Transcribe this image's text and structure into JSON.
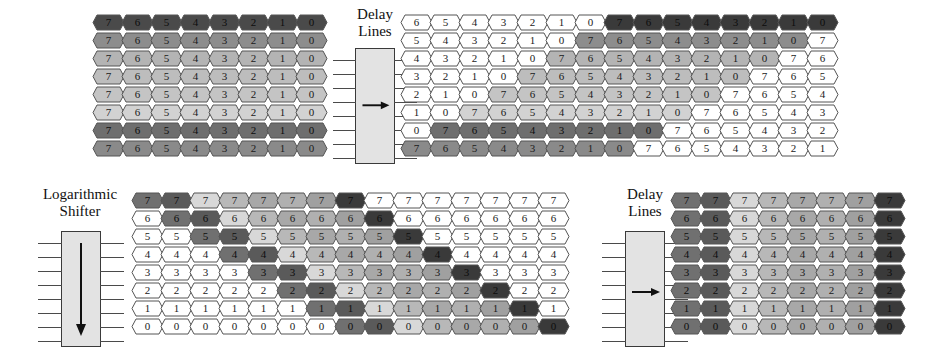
{
  "diagram": {
    "palette": {
      "hex_white": "#ffffff",
      "hex_outline": "#555555",
      "module_fill": "#e3e3e3",
      "module_stroke": "#3a3a3a",
      "text": "#1a1a1a",
      "shades": [
        "#707070",
        "#5a5a5a",
        "#d8d8d8",
        "#b8b8b8",
        "#a8a8a8",
        "#b0b0b0",
        "#a0a0a0",
        "#3a3a3a"
      ],
      "row_shades_topleft": [
        "#4a4a4a",
        "#8d8d8d",
        "#b4b4b4",
        "#bdbdbd",
        "#c4c4c4",
        "#d2d2d2",
        "#6e6e6e",
        "#8a8a8a"
      ]
    },
    "modules": [
      {
        "id": "delay-lines-top",
        "label_line1": "Delay",
        "label_line2": "Lines",
        "arrow": "right-arrow-icon",
        "pin_count": 8
      },
      {
        "id": "logarithmic-shifter",
        "label_line1": "Logarithmic",
        "label_line2": "Shifter",
        "arrow": "down-arrow-icon",
        "pin_count": 8
      },
      {
        "id": "delay-lines-bottom",
        "label_line1": "Delay",
        "label_line2": "Lines",
        "arrow": "right-arrow-icon",
        "pin_count": 8
      }
    ],
    "blocks": {
      "top_left": {
        "name": "delay-lines-input-grid",
        "rows": 8,
        "cols": 8,
        "cells": [
          [
            "7",
            "6",
            "5",
            "4",
            "3",
            "2",
            "1",
            "0"
          ],
          [
            "7",
            "6",
            "5",
            "4",
            "3",
            "2",
            "1",
            "0"
          ],
          [
            "7",
            "6",
            "5",
            "4",
            "3",
            "2",
            "1",
            "0"
          ],
          [
            "7",
            "6",
            "5",
            "4",
            "3",
            "2",
            "1",
            "0"
          ],
          [
            "7",
            "6",
            "5",
            "4",
            "3",
            "2",
            "1",
            "0"
          ],
          [
            "7",
            "6",
            "5",
            "4",
            "3",
            "2",
            "1",
            "0"
          ],
          [
            "7",
            "6",
            "5",
            "4",
            "3",
            "2",
            "1",
            "0"
          ],
          [
            "7",
            "6",
            "5",
            "4",
            "3",
            "2",
            "1",
            "0"
          ]
        ],
        "fills": [
          [
            "#4a4a4a",
            "#4a4a4a",
            "#4a4a4a",
            "#4a4a4a",
            "#4a4a4a",
            "#4a4a4a",
            "#4a4a4a",
            "#4a4a4a"
          ],
          [
            "#8d8d8d",
            "#8d8d8d",
            "#8d8d8d",
            "#8d8d8d",
            "#8d8d8d",
            "#8d8d8d",
            "#8d8d8d",
            "#8d8d8d"
          ],
          [
            "#b4b4b4",
            "#b4b4b4",
            "#b4b4b4",
            "#b4b4b4",
            "#b4b4b4",
            "#b4b4b4",
            "#b4b4b4",
            "#b4b4b4"
          ],
          [
            "#bdbdbd",
            "#bdbdbd",
            "#bdbdbd",
            "#bdbdbd",
            "#bdbdbd",
            "#bdbdbd",
            "#bdbdbd",
            "#bdbdbd"
          ],
          [
            "#c4c4c4",
            "#c4c4c4",
            "#c4c4c4",
            "#c4c4c4",
            "#c4c4c4",
            "#c4c4c4",
            "#c4c4c4",
            "#c4c4c4"
          ],
          [
            "#d2d2d2",
            "#d2d2d2",
            "#d2d2d2",
            "#d2d2d2",
            "#d2d2d2",
            "#d2d2d2",
            "#d2d2d2",
            "#d2d2d2"
          ],
          [
            "#6e6e6e",
            "#6e6e6e",
            "#6e6e6e",
            "#6e6e6e",
            "#6e6e6e",
            "#6e6e6e",
            "#6e6e6e",
            "#6e6e6e"
          ],
          [
            "#8a8a8a",
            "#8a8a8a",
            "#8a8a8a",
            "#8a8a8a",
            "#8a8a8a",
            "#8a8a8a",
            "#8a8a8a",
            "#8a8a8a"
          ]
        ]
      },
      "top_right": {
        "name": "delay-lines-output-grid",
        "rows": 8,
        "cols": 16,
        "cells": [
          [
            "6",
            "5",
            "4",
            "3",
            "2",
            "1",
            "0",
            "7",
            "6",
            "5",
            "4",
            "3",
            "2",
            "1",
            "0",
            ""
          ],
          [
            "5",
            "4",
            "3",
            "2",
            "1",
            "0",
            "7",
            "6",
            "5",
            "4",
            "3",
            "2",
            "1",
            "0",
            "7",
            ""
          ],
          [
            "4",
            "3",
            "2",
            "1",
            "0",
            "7",
            "6",
            "5",
            "4",
            "3",
            "2",
            "1",
            "0",
            "7",
            "6",
            ""
          ],
          [
            "3",
            "2",
            "1",
            "0",
            "7",
            "6",
            "5",
            "4",
            "3",
            "2",
            "1",
            "0",
            "7",
            "6",
            "5",
            ""
          ],
          [
            "2",
            "1",
            "0",
            "7",
            "6",
            "5",
            "4",
            "3",
            "2",
            "1",
            "0",
            "7",
            "6",
            "5",
            "4",
            ""
          ],
          [
            "1",
            "0",
            "7",
            "6",
            "5",
            "4",
            "3",
            "2",
            "1",
            "0",
            "7",
            "6",
            "5",
            "4",
            "3",
            ""
          ],
          [
            "0",
            "7",
            "6",
            "5",
            "4",
            "3",
            "2",
            "1",
            "0",
            "7",
            "6",
            "5",
            "4",
            "3",
            "2",
            ""
          ],
          [
            "7",
            "6",
            "5",
            "4",
            "3",
            "2",
            "1",
            "0",
            "7",
            "6",
            "5",
            "4",
            "3",
            "2",
            "1",
            ""
          ]
        ],
        "fills": [
          [
            "#ffffff",
            "#ffffff",
            "#ffffff",
            "#ffffff",
            "#ffffff",
            "#ffffff",
            "#ffffff",
            "#3a3a3a",
            "#3a3a3a",
            "#3a3a3a",
            "#3a3a3a",
            "#3a3a3a",
            "#3a3a3a",
            "#3a3a3a",
            "#3a3a3a",
            ""
          ],
          [
            "#ffffff",
            "#ffffff",
            "#ffffff",
            "#ffffff",
            "#ffffff",
            "#ffffff",
            "#8d8d8d",
            "#8d8d8d",
            "#8d8d8d",
            "#8d8d8d",
            "#8d8d8d",
            "#8d8d8d",
            "#8d8d8d",
            "#8d8d8d",
            "#ffffff",
            ""
          ],
          [
            "#ffffff",
            "#ffffff",
            "#ffffff",
            "#ffffff",
            "#ffffff",
            "#b4b4b4",
            "#b4b4b4",
            "#b4b4b4",
            "#b4b4b4",
            "#b4b4b4",
            "#b4b4b4",
            "#b4b4b4",
            "#b4b4b4",
            "#ffffff",
            "#ffffff",
            ""
          ],
          [
            "#ffffff",
            "#ffffff",
            "#ffffff",
            "#ffffff",
            "#bdbdbd",
            "#bdbdbd",
            "#bdbdbd",
            "#bdbdbd",
            "#bdbdbd",
            "#bdbdbd",
            "#bdbdbd",
            "#bdbdbd",
            "#ffffff",
            "#ffffff",
            "#ffffff",
            ""
          ],
          [
            "#ffffff",
            "#ffffff",
            "#ffffff",
            "#c4c4c4",
            "#c4c4c4",
            "#c4c4c4",
            "#c4c4c4",
            "#c4c4c4",
            "#c4c4c4",
            "#c4c4c4",
            "#c4c4c4",
            "#ffffff",
            "#ffffff",
            "#ffffff",
            "#ffffff",
            ""
          ],
          [
            "#ffffff",
            "#ffffff",
            "#d2d2d2",
            "#d2d2d2",
            "#d2d2d2",
            "#d2d2d2",
            "#d2d2d2",
            "#d2d2d2",
            "#d2d2d2",
            "#d2d2d2",
            "#ffffff",
            "#ffffff",
            "#ffffff",
            "#ffffff",
            "#ffffff",
            ""
          ],
          [
            "#ffffff",
            "#6e6e6e",
            "#6e6e6e",
            "#6e6e6e",
            "#6e6e6e",
            "#6e6e6e",
            "#6e6e6e",
            "#6e6e6e",
            "#6e6e6e",
            "#ffffff",
            "#ffffff",
            "#ffffff",
            "#ffffff",
            "#ffffff",
            "#ffffff",
            ""
          ],
          [
            "#8a8a8a",
            "#8a8a8a",
            "#8a8a8a",
            "#8a8a8a",
            "#8a8a8a",
            "#8a8a8a",
            "#8a8a8a",
            "#8a8a8a",
            "#ffffff",
            "#ffffff",
            "#ffffff",
            "#ffffff",
            "#ffffff",
            "#ffffff",
            "#ffffff",
            ""
          ]
        ]
      },
      "bottom_middle": {
        "name": "logarithmic-shifter-output-grid",
        "rows": 8,
        "cols": 15,
        "cells": [
          [
            "7",
            "7",
            "7",
            "7",
            "7",
            "7",
            "7",
            "7",
            "7",
            "7",
            "7",
            "7",
            "7",
            "7",
            "7"
          ],
          [
            "6",
            "6",
            "6",
            "6",
            "6",
            "6",
            "6",
            "6",
            "6",
            "6",
            "6",
            "6",
            "6",
            "6",
            "6"
          ],
          [
            "5",
            "5",
            "5",
            "5",
            "5",
            "5",
            "5",
            "5",
            "5",
            "5",
            "5",
            "5",
            "5",
            "5",
            "5"
          ],
          [
            "4",
            "4",
            "4",
            "4",
            "4",
            "4",
            "4",
            "4",
            "4",
            "4",
            "4",
            "4",
            "4",
            "4",
            "4"
          ],
          [
            "3",
            "3",
            "3",
            "3",
            "3",
            "3",
            "3",
            "3",
            "3",
            "3",
            "3",
            "3",
            "3",
            "3",
            "3"
          ],
          [
            "2",
            "2",
            "2",
            "2",
            "2",
            "2",
            "2",
            "2",
            "2",
            "2",
            "2",
            "2",
            "2",
            "2",
            "2"
          ],
          [
            "1",
            "1",
            "1",
            "1",
            "1",
            "1",
            "1",
            "1",
            "1",
            "1",
            "1",
            "1",
            "1",
            "1",
            "1"
          ],
          [
            "0",
            "0",
            "0",
            "0",
            "0",
            "0",
            "0",
            "0",
            "0",
            "0",
            "0",
            "0",
            "0",
            "0",
            "0"
          ]
        ],
        "fills": [
          [
            "#707070",
            "#5a5a5a",
            "#d8d8d8",
            "#b8b8b8",
            "#a8a8a8",
            "#b0b0b0",
            "#a0a0a0",
            "#3a3a3a",
            "#ffffff",
            "#ffffff",
            "#ffffff",
            "#ffffff",
            "#ffffff",
            "#ffffff",
            "#ffffff"
          ],
          [
            "#ffffff",
            "#707070",
            "#5a5a5a",
            "#d8d8d8",
            "#b8b8b8",
            "#a8a8a8",
            "#b0b0b0",
            "#a0a0a0",
            "#3a3a3a",
            "#ffffff",
            "#ffffff",
            "#ffffff",
            "#ffffff",
            "#ffffff",
            "#ffffff"
          ],
          [
            "#ffffff",
            "#ffffff",
            "#707070",
            "#5a5a5a",
            "#d8d8d8",
            "#b8b8b8",
            "#a8a8a8",
            "#b0b0b0",
            "#a0a0a0",
            "#3a3a3a",
            "#ffffff",
            "#ffffff",
            "#ffffff",
            "#ffffff",
            "#ffffff"
          ],
          [
            "#ffffff",
            "#ffffff",
            "#ffffff",
            "#707070",
            "#5a5a5a",
            "#d8d8d8",
            "#b8b8b8",
            "#a8a8a8",
            "#b0b0b0",
            "#a0a0a0",
            "#3a3a3a",
            "#ffffff",
            "#ffffff",
            "#ffffff",
            "#ffffff"
          ],
          [
            "#ffffff",
            "#ffffff",
            "#ffffff",
            "#ffffff",
            "#707070",
            "#5a5a5a",
            "#d8d8d8",
            "#b8b8b8",
            "#a8a8a8",
            "#b0b0b0",
            "#a0a0a0",
            "#3a3a3a",
            "#ffffff",
            "#ffffff",
            "#ffffff"
          ],
          [
            "#ffffff",
            "#ffffff",
            "#ffffff",
            "#ffffff",
            "#ffffff",
            "#707070",
            "#5a5a5a",
            "#d8d8d8",
            "#b8b8b8",
            "#a8a8a8",
            "#b0b0b0",
            "#a0a0a0",
            "#3a3a3a",
            "#ffffff",
            "#ffffff"
          ],
          [
            "#ffffff",
            "#ffffff",
            "#ffffff",
            "#ffffff",
            "#ffffff",
            "#ffffff",
            "#707070",
            "#5a5a5a",
            "#d8d8d8",
            "#b8b8b8",
            "#a8a8a8",
            "#b0b0b0",
            "#a0a0a0",
            "#3a3a3a",
            "#ffffff"
          ],
          [
            "#ffffff",
            "#ffffff",
            "#ffffff",
            "#ffffff",
            "#ffffff",
            "#ffffff",
            "#ffffff",
            "#707070",
            "#5a5a5a",
            "#d8d8d8",
            "#b8b8b8",
            "#a8a8a8",
            "#b0b0b0",
            "#a0a0a0",
            "#3a3a3a"
          ]
        ]
      },
      "bottom_right": {
        "name": "delay-lines-bottom-output-grid",
        "rows": 8,
        "cols": 8,
        "cells": [
          [
            "7",
            "7",
            "7",
            "7",
            "7",
            "7",
            "7",
            "7"
          ],
          [
            "6",
            "6",
            "6",
            "6",
            "6",
            "6",
            "6",
            "6"
          ],
          [
            "5",
            "5",
            "5",
            "5",
            "5",
            "5",
            "5",
            "5"
          ],
          [
            "4",
            "4",
            "4",
            "4",
            "4",
            "4",
            "4",
            "4"
          ],
          [
            "3",
            "3",
            "3",
            "3",
            "3",
            "3",
            "3",
            "3"
          ],
          [
            "2",
            "2",
            "2",
            "2",
            "2",
            "2",
            "2",
            "2"
          ],
          [
            "1",
            "1",
            "1",
            "1",
            "1",
            "1",
            "1",
            "1"
          ],
          [
            "0",
            "0",
            "0",
            "0",
            "0",
            "0",
            "0",
            "0"
          ]
        ],
        "fills": [
          [
            "#707070",
            "#5a5a5a",
            "#d8d8d8",
            "#b8b8b8",
            "#a8a8a8",
            "#b0b0b0",
            "#a0a0a0",
            "#3a3a3a"
          ],
          [
            "#707070",
            "#5a5a5a",
            "#d8d8d8",
            "#b8b8b8",
            "#a8a8a8",
            "#b0b0b0",
            "#a0a0a0",
            "#3a3a3a"
          ],
          [
            "#707070",
            "#5a5a5a",
            "#d8d8d8",
            "#b8b8b8",
            "#a8a8a8",
            "#b0b0b0",
            "#a0a0a0",
            "#3a3a3a"
          ],
          [
            "#707070",
            "#5a5a5a",
            "#d8d8d8",
            "#b8b8b8",
            "#a8a8a8",
            "#b0b0b0",
            "#a0a0a0",
            "#3a3a3a"
          ],
          [
            "#707070",
            "#5a5a5a",
            "#d8d8d8",
            "#b8b8b8",
            "#a8a8a8",
            "#b0b0b0",
            "#a0a0a0",
            "#3a3a3a"
          ],
          [
            "#707070",
            "#5a5a5a",
            "#d8d8d8",
            "#b8b8b8",
            "#a8a8a8",
            "#b0b0b0",
            "#a0a0a0",
            "#3a3a3a"
          ],
          [
            "#707070",
            "#5a5a5a",
            "#d8d8d8",
            "#b8b8b8",
            "#a8a8a8",
            "#b0b0b0",
            "#a0a0a0",
            "#3a3a3a"
          ],
          [
            "#707070",
            "#5a5a5a",
            "#d8d8d8",
            "#b8b8b8",
            "#a8a8a8",
            "#b0b0b0",
            "#a0a0a0",
            "#3a3a3a"
          ]
        ]
      }
    }
  }
}
